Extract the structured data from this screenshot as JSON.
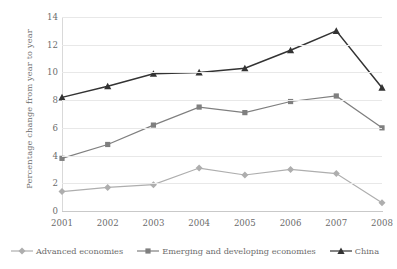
{
  "chart_data": {
    "type": "line",
    "title": "",
    "xlabel": "",
    "ylabel": "Percentage change from year to year",
    "categories": [
      "2001",
      "2002",
      "2003",
      "2004",
      "2005",
      "2006",
      "2007",
      "2008"
    ],
    "ylim": [
      0,
      14
    ],
    "ytick_step": 2,
    "yticks": [
      "0",
      "2",
      "4",
      "6",
      "8",
      "10",
      "12",
      "14"
    ],
    "grid": "horizontal",
    "legend_position": "bottom",
    "series": [
      {
        "name": "Advanced economies",
        "marker": "diamond",
        "color": "#aeaeae",
        "values": [
          1.4,
          1.7,
          1.9,
          3.1,
          2.6,
          3.0,
          2.7,
          0.6
        ]
      },
      {
        "name": "Emerging and developing economies",
        "marker": "square",
        "color": "#7f7f7f",
        "values": [
          3.8,
          4.8,
          6.2,
          7.5,
          7.1,
          7.9,
          8.3,
          6.0
        ]
      },
      {
        "name": "China",
        "marker": "triangle",
        "color": "#333333",
        "values": [
          8.2,
          9.0,
          9.9,
          10.0,
          10.3,
          11.6,
          13.0,
          8.9
        ]
      }
    ]
  },
  "axis": {
    "y_title": "Percentage change from year to year"
  }
}
